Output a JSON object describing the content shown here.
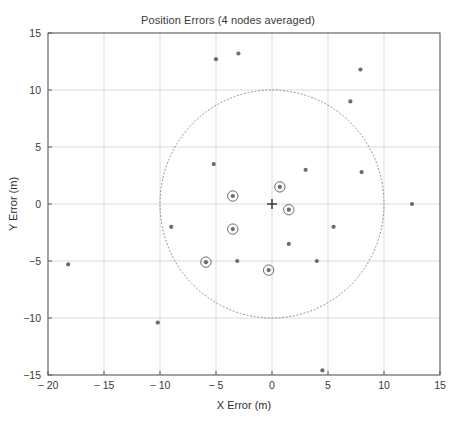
{
  "chart_data": {
    "type": "scatter",
    "title": "Position Errors (4 nodes averaged)",
    "xlabel": "X Error (m)",
    "ylabel": "Y Error (m)",
    "xlim": [
      -20,
      15
    ],
    "ylim": [
      -15,
      15
    ],
    "xticks": [
      -20,
      -15,
      -10,
      -5,
      0,
      5,
      10,
      15
    ],
    "yticks": [
      -15,
      -10,
      -5,
      0,
      5,
      10,
      15
    ],
    "xtick_labels": [
      "-20",
      "-15",
      "-10",
      "-5",
      "0",
      "5",
      "10",
      "15"
    ],
    "ytick_labels": [
      "-15",
      "-10",
      "-5",
      "0",
      "5",
      "10",
      "15"
    ],
    "grid": true,
    "legend": null,
    "marker_color": "#6b6b72",
    "circle_color": "#6b6b72",
    "grid_color": "#d2d2d2",
    "axis_color": "#58585c",
    "origin_marker": {
      "name": "origin-cross",
      "x": 0,
      "y": 0,
      "symbol": "+"
    },
    "reference_circle": {
      "center_x": 0,
      "center_y": 0,
      "radius": 10,
      "style": "dotted"
    },
    "series": [
      {
        "name": "errors-plain",
        "marker": "dot",
        "points": [
          [
            -5.0,
            12.7
          ],
          [
            -3.0,
            13.2
          ],
          [
            7.9,
            11.8
          ],
          [
            7.0,
            9.0
          ],
          [
            -5.2,
            3.5
          ],
          [
            3.0,
            3.0
          ],
          [
            8.0,
            2.8
          ],
          [
            12.5,
            0.0
          ],
          [
            -9.0,
            -2.0
          ],
          [
            5.5,
            -2.0
          ],
          [
            1.5,
            -3.5
          ],
          [
            -3.1,
            -5.0
          ],
          [
            4.0,
            -5.0
          ],
          [
            -18.2,
            -5.3
          ],
          [
            -10.2,
            -10.4
          ],
          [
            4.5,
            -14.6
          ]
        ]
      },
      {
        "name": "errors-circled",
        "marker": "circled-dot",
        "points": [
          [
            0.7,
            1.5
          ],
          [
            -3.5,
            0.7
          ],
          [
            1.5,
            -0.5
          ],
          [
            -3.5,
            -2.2
          ],
          [
            -5.9,
            -5.1
          ],
          [
            -0.3,
            -5.8
          ]
        ]
      }
    ]
  }
}
